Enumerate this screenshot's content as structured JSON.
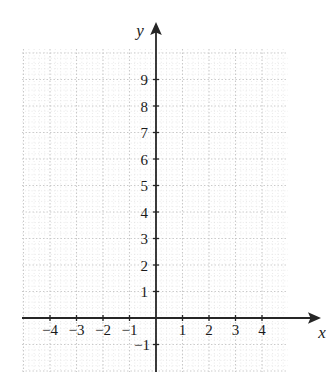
{
  "figure": {
    "kind": "cartesian-coordinate-grid",
    "background_color": "#ffffff",
    "axis_color": "#262626",
    "grid_major_color": "#c9c9c9",
    "grid_minor_color": "#dcdcdc",
    "label_color": "#1a1a1a"
  },
  "axis_titles": {
    "x": "x",
    "y": "y"
  },
  "chart_data": {
    "type": "scatter",
    "title": "",
    "xlabel": "x",
    "ylabel": "y",
    "grid": true,
    "legend": null,
    "series": [],
    "x": [],
    "y": [],
    "xlim": [
      -5.05,
      5.0
    ],
    "ylim": [
      -2.05,
      10.2
    ],
    "x_tick_values": [
      -4,
      -3,
      -2,
      -1,
      1,
      2,
      3,
      4
    ],
    "x_tick_labels": [
      "−4",
      "−3",
      "−2",
      "−1",
      "1",
      "2",
      "3",
      "4"
    ],
    "y_tick_values": [
      -1,
      1,
      2,
      3,
      4,
      5,
      6,
      7,
      8,
      9
    ],
    "y_tick_labels": [
      "−1",
      "1",
      "2",
      "3",
      "4",
      "5",
      "6",
      "7",
      "8",
      "9"
    ],
    "major_grid_step": 1,
    "minor_grid_divisions": 5,
    "arrows": [
      "x-positive",
      "y-positive"
    ]
  },
  "geometry": {
    "origin_x": 156,
    "origin_y": 318,
    "unit_px": 26.5,
    "grid_left": 22,
    "grid_right": 288,
    "grid_top": 49,
    "grid_bottom": 372,
    "x_axis_arrow_tip": 321,
    "y_axis_arrow_tip": 22
  }
}
